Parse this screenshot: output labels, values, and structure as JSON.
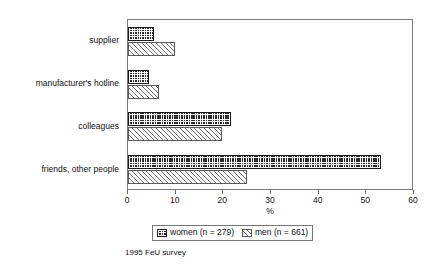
{
  "chart_data": {
    "type": "bar",
    "orientation": "horizontal",
    "title": "",
    "xlabel": "%",
    "ylabel": "",
    "xlim": [
      0,
      60
    ],
    "xticks": [
      0,
      10,
      20,
      30,
      40,
      50,
      60
    ],
    "grid": false,
    "legend_position": "below-axis",
    "categories": [
      "supplier",
      "manufacturer's hotline",
      "colleagues",
      "friends, other people"
    ],
    "series": [
      {
        "name": "women (n = 279)",
        "short_name": "women",
        "n": 279,
        "pattern": "dark-checker",
        "color": "#2b2b2b",
        "values": [
          5.5,
          4.4,
          21.6,
          53.0
        ]
      },
      {
        "name": "men (n = 661)",
        "short_name": "men",
        "n": 661,
        "pattern": "diagonal-hatch",
        "color": "#ffffff",
        "values": [
          9.9,
          6.5,
          19.7,
          25.0
        ]
      }
    ],
    "caption": "1995 FeU survey"
  },
  "axis": {
    "x_title": "%",
    "tick_labels": [
      "0",
      "10",
      "20",
      "30",
      "40",
      "50",
      "60"
    ]
  },
  "legend": {
    "entries": [
      {
        "label": "women (n = 279)"
      },
      {
        "label": "men (n = 661)"
      }
    ]
  },
  "footer": {
    "caption": "1995 FeU survey"
  },
  "colors": {
    "women_fill": "#2b2b2b",
    "men_fill": "#ffffff",
    "hatch": "#6f6f6f",
    "frame": "#7a7a7a",
    "text": "#111111"
  }
}
